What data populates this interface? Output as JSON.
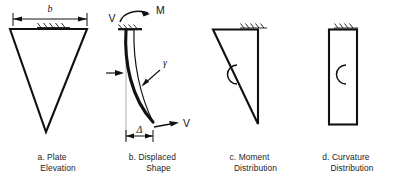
{
  "figure": {
    "background_color": "#ffffff",
    "line_color": "#111111"
  },
  "panels": [
    {
      "id": "plate-elevation",
      "caption_line1": "a. Plate",
      "caption_line2": "Elevation",
      "shape": "inverted-triangle",
      "labels": {
        "width_dimension": "b"
      },
      "support": "fixed-hatch-top"
    },
    {
      "id": "displaced-shape",
      "caption_line1": "b. Displaced",
      "caption_line2": "Shape",
      "shape": "deflected-curved-plate",
      "labels": {
        "shear_top": "V",
        "moment": "M",
        "shear_strain": "γ",
        "deflection": "Δ",
        "shear_bottom": "V"
      },
      "support": "fixed-hatch-top"
    },
    {
      "id": "moment-distribution",
      "caption_line1": "c. Moment",
      "caption_line2": "Distribution",
      "shape": "right-triangle",
      "labels": {
        "arc": "C"
      },
      "support": "fixed-hatch-top"
    },
    {
      "id": "curvature-distribution",
      "caption_line1": "d. Curvature",
      "caption_line2": "Distribution",
      "shape": "rectangle",
      "labels": {
        "arc": "C"
      },
      "support": "fixed-hatch-top"
    }
  ]
}
